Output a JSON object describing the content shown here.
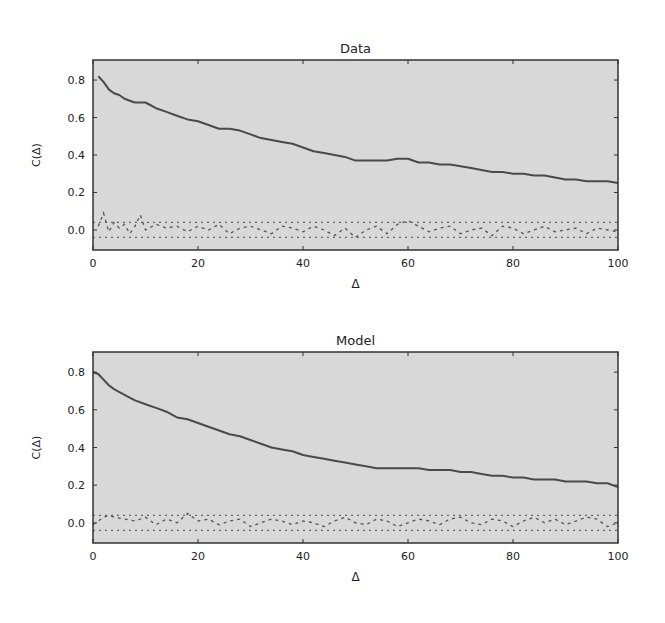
{
  "figure": {
    "background": "#ffffff",
    "plot_background": "#d8d8d8",
    "line_color": "#4a4a4a",
    "noise_color": "#555555",
    "band_color": "#666666"
  },
  "chart_data": [
    {
      "type": "line",
      "title": "Data",
      "xlabel": "Δ",
      "ylabel": "C(Δ)",
      "xlim": [
        0,
        100
      ],
      "ylim": [
        -0.107,
        0.907
      ],
      "xticks": [
        0,
        20,
        40,
        60,
        80,
        100
      ],
      "xtick_labels": [
        "0",
        "20",
        "40",
        "60",
        "80",
        "100"
      ],
      "yticks": [
        0.0,
        0.2,
        0.4,
        0.6,
        0.8
      ],
      "ytick_labels": [
        "0.0",
        "0.2",
        "0.4",
        "0.6",
        "0.8"
      ],
      "grid": false,
      "legend": null,
      "confidence_band": [
        -0.04,
        0.04
      ],
      "series": [
        {
          "name": "autocorrelation",
          "style": "solid",
          "x": [
            1,
            2,
            3,
            4,
            5,
            6,
            7,
            8,
            9,
            10,
            12,
            14,
            16,
            18,
            20,
            22,
            24,
            26,
            28,
            30,
            32,
            34,
            36,
            38,
            40,
            42,
            44,
            46,
            48,
            50,
            52,
            54,
            56,
            58,
            60,
            62,
            64,
            66,
            68,
            70,
            72,
            74,
            76,
            78,
            80,
            82,
            84,
            86,
            88,
            90,
            92,
            94,
            96,
            98,
            100
          ],
          "values": [
            0.82,
            0.79,
            0.75,
            0.73,
            0.72,
            0.7,
            0.69,
            0.68,
            0.68,
            0.68,
            0.65,
            0.63,
            0.61,
            0.59,
            0.58,
            0.56,
            0.54,
            0.54,
            0.53,
            0.51,
            0.49,
            0.48,
            0.47,
            0.46,
            0.44,
            0.42,
            0.41,
            0.4,
            0.39,
            0.37,
            0.37,
            0.37,
            0.37,
            0.38,
            0.38,
            0.36,
            0.36,
            0.35,
            0.35,
            0.34,
            0.33,
            0.32,
            0.31,
            0.31,
            0.3,
            0.3,
            0.29,
            0.29,
            0.28,
            0.27,
            0.27,
            0.26,
            0.26,
            0.26,
            0.25
          ]
        },
        {
          "name": "shuffled",
          "style": "dashed",
          "x": [
            1,
            2,
            3,
            4,
            5,
            6,
            7,
            8,
            9,
            10,
            12,
            14,
            16,
            18,
            20,
            22,
            24,
            26,
            28,
            30,
            32,
            34,
            36,
            38,
            40,
            42,
            44,
            46,
            48,
            50,
            52,
            54,
            56,
            58,
            60,
            62,
            64,
            66,
            68,
            70,
            72,
            74,
            76,
            78,
            80,
            82,
            84,
            86,
            88,
            90,
            92,
            94,
            96,
            98,
            100
          ],
          "values": [
            0.02,
            0.09,
            -0.01,
            0.04,
            0.01,
            0.03,
            -0.02,
            0.02,
            0.08,
            0.0,
            0.03,
            0.01,
            0.02,
            -0.01,
            0.02,
            0.0,
            0.03,
            -0.02,
            0.01,
            0.02,
            0.0,
            -0.02,
            0.02,
            0.01,
            -0.01,
            0.02,
            0.0,
            -0.03,
            0.01,
            -0.04,
            0.0,
            0.02,
            -0.02,
            0.03,
            0.05,
            0.02,
            -0.01,
            0.01,
            0.02,
            -0.02,
            0.0,
            0.01,
            -0.03,
            0.02,
            0.01,
            -0.02,
            0.0,
            0.02,
            -0.01,
            0.0,
            0.01,
            -0.02,
            0.01,
            0.0,
            -0.01
          ]
        }
      ]
    },
    {
      "type": "line",
      "title": "Model",
      "xlabel": "Δ",
      "ylabel": "C(Δ)",
      "xlim": [
        0,
        100
      ],
      "ylim": [
        -0.107,
        0.907
      ],
      "xticks": [
        0,
        20,
        40,
        60,
        80,
        100
      ],
      "xtick_labels": [
        "0",
        "20",
        "40",
        "60",
        "80",
        "100"
      ],
      "yticks": [
        0.0,
        0.2,
        0.4,
        0.6,
        0.8
      ],
      "ytick_labels": [
        "0.0",
        "0.2",
        "0.4",
        "0.6",
        "0.8"
      ],
      "grid": false,
      "legend": null,
      "confidence_band": [
        -0.04,
        0.04
      ],
      "series": [
        {
          "name": "autocorrelation",
          "style": "solid",
          "x": [
            0,
            1,
            2,
            3,
            4,
            6,
            8,
            10,
            12,
            14,
            16,
            18,
            20,
            22,
            24,
            26,
            28,
            30,
            32,
            34,
            36,
            38,
            40,
            42,
            44,
            46,
            48,
            50,
            52,
            54,
            56,
            58,
            60,
            62,
            64,
            66,
            68,
            70,
            72,
            74,
            76,
            78,
            80,
            82,
            84,
            86,
            88,
            90,
            92,
            94,
            96,
            98,
            100
          ],
          "values": [
            0.8,
            0.79,
            0.76,
            0.73,
            0.71,
            0.68,
            0.65,
            0.63,
            0.61,
            0.59,
            0.56,
            0.55,
            0.53,
            0.51,
            0.49,
            0.47,
            0.46,
            0.44,
            0.42,
            0.4,
            0.39,
            0.38,
            0.36,
            0.35,
            0.34,
            0.33,
            0.32,
            0.31,
            0.3,
            0.29,
            0.29,
            0.29,
            0.29,
            0.29,
            0.28,
            0.28,
            0.28,
            0.27,
            0.27,
            0.26,
            0.25,
            0.25,
            0.24,
            0.24,
            0.23,
            0.23,
            0.23,
            0.22,
            0.22,
            0.22,
            0.21,
            0.21,
            0.19
          ]
        },
        {
          "name": "shuffled",
          "style": "dashed",
          "x": [
            0,
            1,
            2,
            3,
            4,
            6,
            8,
            10,
            12,
            14,
            16,
            18,
            20,
            22,
            24,
            26,
            28,
            30,
            32,
            34,
            36,
            38,
            40,
            42,
            44,
            46,
            48,
            50,
            52,
            54,
            56,
            58,
            60,
            62,
            64,
            66,
            68,
            70,
            72,
            74,
            76,
            78,
            80,
            82,
            84,
            86,
            88,
            90,
            92,
            94,
            96,
            98,
            100
          ],
          "values": [
            -0.01,
            0.01,
            0.03,
            0.04,
            0.03,
            0.02,
            0.01,
            0.03,
            -0.01,
            0.02,
            0.0,
            0.05,
            0.01,
            0.02,
            -0.01,
            0.01,
            0.02,
            -0.02,
            0.0,
            0.02,
            0.01,
            -0.01,
            0.01,
            0.0,
            -0.02,
            0.01,
            0.03,
            0.0,
            -0.01,
            0.02,
            0.01,
            -0.02,
            0.0,
            0.02,
            0.01,
            -0.01,
            0.02,
            0.03,
            0.0,
            -0.01,
            0.02,
            0.01,
            -0.02,
            0.01,
            0.03,
            0.0,
            0.02,
            -0.01,
            0.01,
            0.03,
            0.02,
            -0.02,
            0.0
          ]
        }
      ]
    }
  ],
  "panels": [
    {
      "frame": {
        "left": 93,
        "top": 60,
        "right": 618,
        "bottom": 250
      }
    },
    {
      "frame": {
        "left": 93,
        "top": 352,
        "right": 618,
        "bottom": 543
      }
    }
  ]
}
